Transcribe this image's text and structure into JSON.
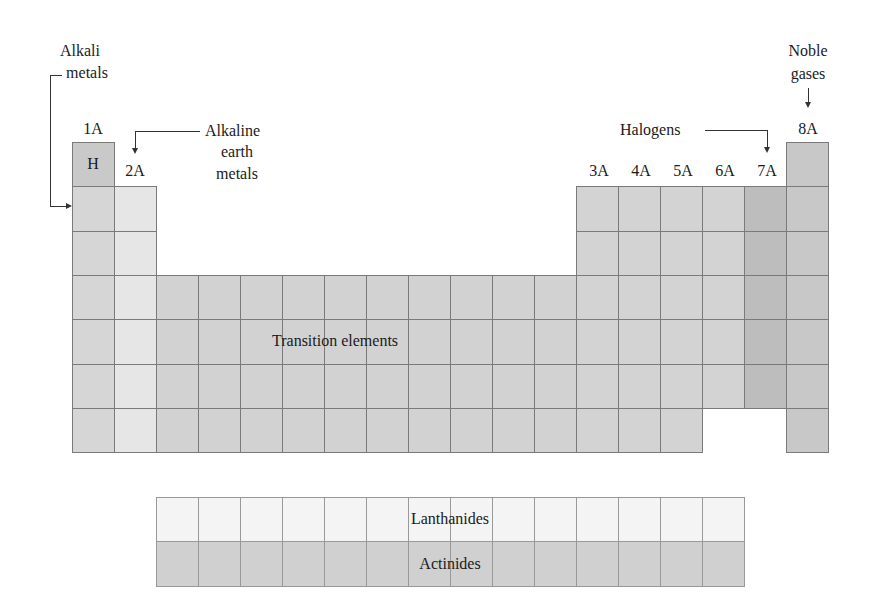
{
  "diagram": {
    "labels": {
      "alkali_line1": "Alkali",
      "alkali_line2": "metals",
      "alkaline_line1": "Alkaline",
      "alkaline_line2": "earth",
      "alkaline_line3": "metals",
      "halogens": "Halogens",
      "noble_line1": "Noble",
      "noble_line2": "gases",
      "transition": "Transition elements",
      "lanthanides": "Lanthanides",
      "actinides": "Actinides",
      "hydrogen": "H"
    },
    "groups": [
      "1A",
      "2A",
      "3A",
      "4A",
      "5A",
      "6A",
      "7A",
      "8A"
    ],
    "colors": {
      "hydrogen": "#c9c9c9",
      "alkali": "#d6d6d6",
      "alkaline_earth": "#e6e6e6",
      "transition": "#d2d2d2",
      "main_p": "#d3d3d3",
      "halogens": "#bdbdbd",
      "noble": "#c8c8c8",
      "lanthanides": "#f4f4f4",
      "actinides": "#d0d0d0",
      "border": "#7a7a7a"
    }
  }
}
